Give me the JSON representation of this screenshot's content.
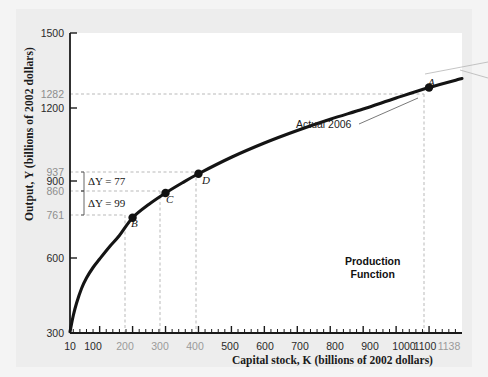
{
  "figure": {
    "background_color": "#f0f0f0",
    "plot_background_color": "#ffffff",
    "axis_color": "#1a1a1a",
    "curve_color": "#141414",
    "guide_color": "#b9b9b9"
  },
  "chart_data": {
    "type": "line",
    "title": "",
    "subtitle": "",
    "xlabel": "Capital stock, K (billions of 2002 dollars)",
    "ylabel": "Output, Y (billions of 2002 dollars)",
    "xlim": [
      10,
      1200
    ],
    "ylim": [
      300,
      1500
    ],
    "grid": false,
    "legend": "none",
    "x_ticks": [
      10,
      100,
      200,
      300,
      400,
      500,
      600,
      700,
      800,
      900,
      1000,
      1100,
      1138
    ],
    "x_tick_labels": [
      "10",
      "100",
      "200",
      "300",
      "400",
      "500",
      "600",
      "700",
      "800",
      "900",
      "1000",
      "1100",
      "1138"
    ],
    "x_tick_muted": [
      false,
      false,
      true,
      true,
      true,
      false,
      false,
      false,
      false,
      false,
      false,
      false,
      true
    ],
    "y_ticks": [
      300,
      600,
      761,
      860,
      900,
      937,
      1200,
      1282,
      1500
    ],
    "y_tick_labels": [
      "300",
      "600",
      "761",
      "860",
      "900",
      "937",
      "1200",
      "1282",
      "1500"
    ],
    "y_tick_muted": [
      false,
      false,
      true,
      true,
      false,
      true,
      false,
      true,
      false
    ],
    "y_major_ticks": [
      300,
      600,
      900,
      1200,
      1500
    ],
    "series": [
      {
        "name": "Production Function",
        "points": [
          {
            "x": 10,
            "y": 305
          },
          {
            "x": 20,
            "y": 370
          },
          {
            "x": 30,
            "y": 420
          },
          {
            "x": 45,
            "y": 478
          },
          {
            "x": 60,
            "y": 520
          },
          {
            "x": 80,
            "y": 562
          },
          {
            "x": 100,
            "y": 596
          },
          {
            "x": 130,
            "y": 645
          },
          {
            "x": 160,
            "y": 690
          },
          {
            "x": 200,
            "y": 761
          },
          {
            "x": 250,
            "y": 815
          },
          {
            "x": 300,
            "y": 860
          },
          {
            "x": 350,
            "y": 900
          },
          {
            "x": 400,
            "y": 937
          },
          {
            "x": 500,
            "y": 1003
          },
          {
            "x": 600,
            "y": 1060
          },
          {
            "x": 700,
            "y": 1110
          },
          {
            "x": 800,
            "y": 1155
          },
          {
            "x": 900,
            "y": 1196
          },
          {
            "x": 1000,
            "y": 1240
          },
          {
            "x": 1100,
            "y": 1282
          },
          {
            "x": 1200,
            "y": 1318
          }
        ]
      }
    ],
    "markers": [
      {
        "label": "A",
        "x": 1100,
        "y": 1282
      },
      {
        "label": "B",
        "x": 200,
        "y": 761
      },
      {
        "label": "C",
        "x": 300,
        "y": 860
      },
      {
        "label": "D",
        "x": 400,
        "y": 937
      }
    ],
    "annotations": [
      {
        "name": "delta-y-77",
        "text": "ΔY = 77",
        "from_y": 860,
        "to_y": 937,
        "value": 77
      },
      {
        "name": "delta-y-99",
        "text": "ΔY = 99",
        "from_y": 761,
        "to_y": 860,
        "value": 99
      },
      {
        "name": "actual-2006",
        "text": "Actual 2006",
        "points_to": "A"
      },
      {
        "name": "production-function",
        "line1": "Production",
        "line2": "Function"
      }
    ]
  },
  "labels": {
    "y_axis_title": "Output, Y (billions of 2002 dollars)",
    "x_axis_title": "Capital stock, K (billions of 2002 dollars)",
    "point_a": "A",
    "point_b": "B",
    "point_c": "C",
    "point_d": "D",
    "delta_77": "ΔY = 77",
    "delta_99": "ΔY = 99",
    "actual_2006": "Actual 2006",
    "production": "Production",
    "function": "Function",
    "y_1500": "1500",
    "y_1282": "1282",
    "y_1200": "1200",
    "y_937": "937",
    "y_900": "900",
    "y_860": "860",
    "y_761": "761",
    "y_600": "600",
    "y_300": "300",
    "x_10": "10",
    "x_100": "100",
    "x_200": "200",
    "x_300": "300",
    "x_400": "400",
    "x_500": "500",
    "x_600": "600",
    "x_700": "700",
    "x_800": "800",
    "x_900": "900",
    "x_1000": "1000",
    "x_1100": "1100",
    "x_1138": "1138"
  }
}
